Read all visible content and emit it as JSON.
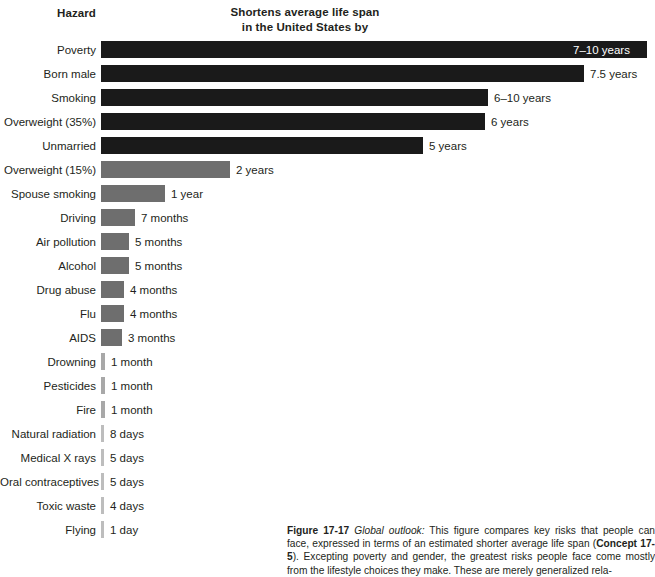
{
  "header": {
    "hazard_label": "Hazard",
    "value_label_line1": "Shortens average life span",
    "value_label_line2": "in the United States by"
  },
  "caption": {
    "figure_number": "Figure 17-17",
    "lead_in": "Global outlook:",
    "text_part1": " This figure compares key risks that people can face, expressed in terms of an estimated shorter average life span (",
    "concept_ref": "Concept 17-5",
    "text_part2": "). Excepting poverty and gender, the greatest risks people face come mostly from the lifestyle choices they make. These are merely generalized rela-"
  },
  "chart_data": {
    "type": "bar",
    "title": "Shortens average life span in the United States by",
    "xlabel": "",
    "ylabel": "Hazard",
    "orientation": "horizontal",
    "grid": false,
    "legend": false,
    "categories": [
      "Poverty",
      "Born male",
      "Smoking",
      "Overweight (35%)",
      "Unmarried",
      "Overweight (15%)",
      "Spouse smoking",
      "Driving",
      "Air pollution",
      "Alcohol",
      "Drug abuse",
      "Flu",
      "AIDS",
      "Drowning",
      "Pesticides",
      "Fire",
      "Natural radiation",
      "Medical X rays",
      "Oral contraceptives",
      "Toxic waste",
      "Flying"
    ],
    "value_labels": [
      "7–10 years",
      "7.5 years",
      "6–10 years",
      "6 years",
      "5 years",
      "2 years",
      "1 year",
      "7 months",
      "5 months",
      "5 months",
      "4 months",
      "4 months",
      "3 months",
      "1 month",
      "1 month",
      "1 month",
      "8 days",
      "5 days",
      "5 days",
      "4 days",
      "1 day"
    ],
    "values_years": [
      8.5,
      7.5,
      8.0,
      6.0,
      5.0,
      2.0,
      1.0,
      0.583,
      0.417,
      0.417,
      0.333,
      0.333,
      0.25,
      0.083,
      0.083,
      0.083,
      0.0219,
      0.0137,
      0.0137,
      0.011,
      0.0027
    ],
    "bar_widths_px": [
      546,
      483,
      387,
      384,
      322,
      129,
      64,
      34,
      28,
      28,
      23,
      23,
      21,
      4,
      4,
      4,
      3,
      3,
      3,
      3,
      3
    ],
    "bar_colors": [
      "#1a1a1a",
      "#1a1a1a",
      "#1a1a1a",
      "#1a1a1a",
      "#1a1a1a",
      "#6e6e6e",
      "#6e6e6e",
      "#6e6e6e",
      "#6e6e6e",
      "#6e6e6e",
      "#6e6e6e",
      "#6e6e6e",
      "#6e6e6e",
      "#a8a8a8",
      "#a8a8a8",
      "#a8a8a8",
      "#bdbdbd",
      "#bdbdbd",
      "#bdbdbd",
      "#bdbdbd",
      "#bdbdbd"
    ],
    "label_inside_bar": [
      true,
      false,
      false,
      false,
      false,
      false,
      false,
      false,
      false,
      false,
      false,
      false,
      false,
      false,
      false,
      false,
      false,
      false,
      false,
      false,
      false
    ]
  }
}
